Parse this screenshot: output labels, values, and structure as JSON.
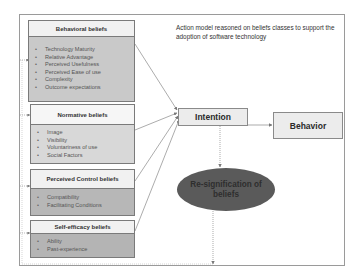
{
  "title": "Action model reasoned on beliefs classes to support  the adoption of software technology",
  "belief_groups": [
    {
      "header": "Behavioral beliefs",
      "items": [
        "Technology Maturity",
        "Relative Advantage",
        "Perceived Usefulness",
        "Perceived Ease of use",
        "Complexity",
        "Outcome  expectations"
      ]
    },
    {
      "header": "Normative beliefs",
      "items": [
        "Image",
        "Visibility",
        "Voluntariness  of use",
        "Social Factors"
      ]
    },
    {
      "header": "Perceived Control beliefs",
      "items": [
        "Compatibility",
        "Facilitating Conditions"
      ]
    },
    {
      "header": "Self-efficacy beliefs",
      "items": [
        "Ability",
        "Past-experience"
      ]
    }
  ],
  "bullet": "•",
  "nodes": {
    "intention": "Intention",
    "behavior": "Behavior",
    "resignification": "Re-signification of beliefs"
  },
  "colors": {
    "ellipse_fill": "#5a5a5a",
    "box_header": "#f1f1f1",
    "line": "#777777"
  }
}
